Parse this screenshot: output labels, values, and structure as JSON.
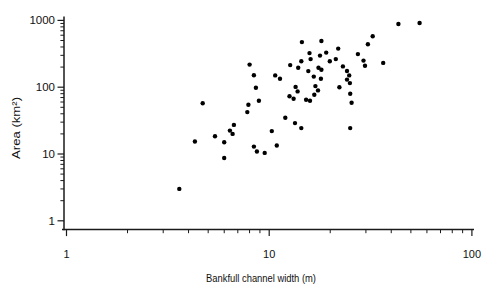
{
  "figure": {
    "background": "#ffffff",
    "axis_color": "#1a1a1a",
    "marker_color": "#000000"
  },
  "chart_data": {
    "type": "scatter",
    "title": "",
    "xlabel": "Bankfull channel width (m)",
    "ylabel": "Area (km²)",
    "xscale": "log",
    "yscale": "log",
    "xlim": [
      1,
      100
    ],
    "ylim": [
      1,
      1000
    ],
    "x_ticks": [
      "1",
      "10",
      "100"
    ],
    "y_ticks": [
      "1",
      "10",
      "100",
      "1000"
    ],
    "minor_ticks": "log decades (2-9 per decade), drawn outward",
    "grid": false,
    "legend": false,
    "marker": {
      "shape": "circle",
      "color": "#000000",
      "diameter_px": 4.4
    },
    "points": [
      [
        3.6,
        3.0
      ],
      [
        4.3,
        15.4
      ],
      [
        4.7,
        57.5
      ],
      [
        5.4,
        18.5
      ],
      [
        6.0,
        8.7
      ],
      [
        6.0,
        15.0
      ],
      [
        6.4,
        22.4
      ],
      [
        6.6,
        20.0
      ],
      [
        6.7,
        27.3
      ],
      [
        7.8,
        42.4
      ],
      [
        7.9,
        54.6
      ],
      [
        8.0,
        218
      ],
      [
        8.4,
        151
      ],
      [
        8.4,
        12.9
      ],
      [
        8.6,
        98
      ],
      [
        8.7,
        10.9
      ],
      [
        8.9,
        62.7
      ],
      [
        9.5,
        10.4
      ],
      [
        10.3,
        22.0
      ],
      [
        10.7,
        150
      ],
      [
        10.9,
        13.4
      ],
      [
        11.3,
        134
      ],
      [
        12.0,
        34.8
      ],
      [
        12.6,
        73.3
      ],
      [
        12.7,
        214
      ],
      [
        13.2,
        67.1
      ],
      [
        13.4,
        29.0
      ],
      [
        13.5,
        101
      ],
      [
        13.8,
        86.5
      ],
      [
        13.9,
        196
      ],
      [
        14.4,
        245
      ],
      [
        14.4,
        24.4
      ],
      [
        14.5,
        474
      ],
      [
        15.2,
        64.9
      ],
      [
        15.6,
        174
      ],
      [
        15.8,
        324
      ],
      [
        15.9,
        62.7
      ],
      [
        16.0,
        263
      ],
      [
        16.6,
        144
      ],
      [
        16.7,
        77.1
      ],
      [
        16.9,
        104
      ],
      [
        17.4,
        89.5
      ],
      [
        17.5,
        196
      ],
      [
        17.8,
        297
      ],
      [
        18.0,
        134
      ],
      [
        18.1,
        491
      ],
      [
        18.1,
        183
      ],
      [
        19.1,
        330
      ],
      [
        19.9,
        245
      ],
      [
        21.3,
        263
      ],
      [
        21.9,
        378
      ],
      [
        22.2,
        100
      ],
      [
        23.1,
        205
      ],
      [
        24.2,
        175
      ],
      [
        24.2,
        130
      ],
      [
        24.8,
        150
      ],
      [
        25.0,
        115
      ],
      [
        25.1,
        79.8
      ],
      [
        25.1,
        24.4
      ],
      [
        25.5,
        58.5
      ],
      [
        27.4,
        313
      ],
      [
        29.2,
        250
      ],
      [
        29.7,
        210
      ],
      [
        30.7,
        440
      ],
      [
        32.4,
        579
      ],
      [
        36.5,
        231
      ],
      [
        43.4,
        883
      ],
      [
        55.2,
        914
      ]
    ]
  }
}
